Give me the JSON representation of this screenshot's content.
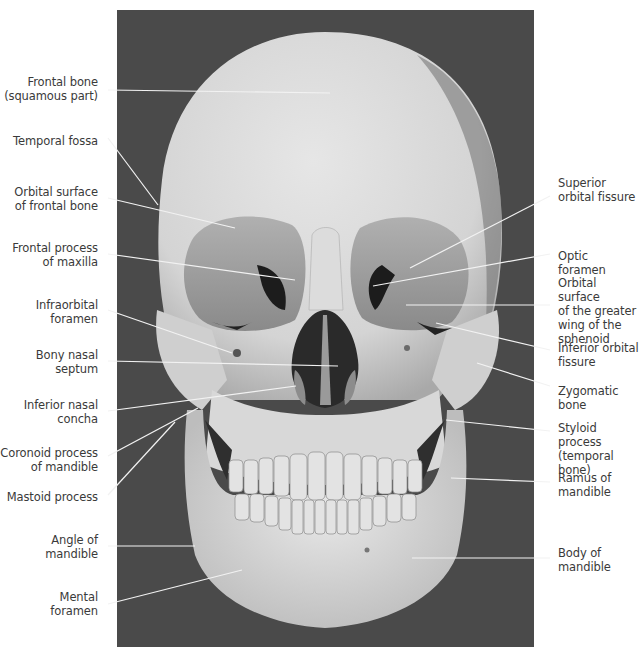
{
  "figure": {
    "background_color": "#ffffff",
    "photo_background": "#4a4a4a",
    "bone_color": "#d9d9d9",
    "label_color": "#3a3a3a",
    "leader_color": "#f2f2f2"
  },
  "labels_left": [
    {
      "id": "frontal-bone",
      "text": "Frontal bone\n(squamous part)",
      "x": 0,
      "y": 75,
      "w": 98,
      "line": [
        108,
        90,
        330,
        93
      ]
    },
    {
      "id": "temporal-fossa",
      "text": "Temporal fossa",
      "x": 0,
      "y": 134,
      "w": 98,
      "line": [
        108,
        138,
        158,
        205
      ]
    },
    {
      "id": "orbital-surface-frontal",
      "text": "Orbital surface\nof frontal bone",
      "x": 0,
      "y": 185,
      "w": 98,
      "line": [
        108,
        198,
        235,
        228
      ]
    },
    {
      "id": "frontal-process-maxilla",
      "text": "Frontal process\nof maxilla",
      "x": 0,
      "y": 241,
      "w": 98,
      "line": [
        108,
        254,
        295,
        280
      ]
    },
    {
      "id": "infraorbital-foramen",
      "text": "Infraorbital\nforamen",
      "x": 0,
      "y": 298,
      "w": 98,
      "line": [
        108,
        310,
        232,
        353
      ]
    },
    {
      "id": "bony-nasal-septum",
      "text": "Bony nasal\nseptum",
      "x": 0,
      "y": 348,
      "w": 98,
      "line": [
        108,
        361,
        338,
        366
      ]
    },
    {
      "id": "inferior-nasal-concha",
      "text": "Inferior nasal\nconcha",
      "x": 0,
      "y": 398,
      "w": 98,
      "line": [
        108,
        411,
        296,
        386
      ]
    },
    {
      "id": "coronoid-process",
      "text": "Coronoid process\nof mandible",
      "x": 0,
      "y": 446,
      "w": 98,
      "line": [
        108,
        456,
        198,
        408
      ]
    },
    {
      "id": "mastoid-process",
      "text": "Mastoid process",
      "x": 0,
      "y": 490,
      "w": 98,
      "line": [
        108,
        495,
        175,
        422
      ]
    },
    {
      "id": "angle-of-mandible",
      "text": "Angle of\nmandible",
      "x": 0,
      "y": 533,
      "w": 98,
      "line": [
        108,
        546,
        195,
        546
      ]
    },
    {
      "id": "mental-foramen",
      "text": "Mental\nforamen",
      "x": 0,
      "y": 590,
      "w": 98,
      "line": [
        108,
        604,
        242,
        570
      ]
    }
  ],
  "labels_right": [
    {
      "id": "superior-orbital-fissure",
      "text": "Superior\norbital fissure",
      "x": 558,
      "y": 176,
      "w": 81,
      "line": [
        550,
        196,
        410,
        268
      ]
    },
    {
      "id": "optic-foramen",
      "text": "Optic foramen",
      "x": 558,
      "y": 249,
      "w": 81,
      "line": [
        550,
        254,
        373,
        286
      ]
    },
    {
      "id": "orbital-surface-sphenoid",
      "text": "Orbital surface\nof the greater\nwing of the\nsphenoid",
      "x": 558,
      "y": 276,
      "w": 81,
      "line": [
        550,
        305,
        406,
        305
      ]
    },
    {
      "id": "inferior-orbital-fissure",
      "text": "Inferior orbital\nfissure",
      "x": 558,
      "y": 341,
      "w": 81,
      "line": [
        550,
        350,
        436,
        323
      ]
    },
    {
      "id": "zygomatic-bone",
      "text": "Zygomatic bone",
      "x": 558,
      "y": 384,
      "w": 81,
      "line": [
        550,
        386,
        477,
        363
      ]
    },
    {
      "id": "styloid-process",
      "text": "Styloid process\n(temporal bone)",
      "x": 558,
      "y": 421,
      "w": 81,
      "line": [
        550,
        431,
        446,
        420
      ]
    },
    {
      "id": "ramus-of-mandible",
      "text": "Ramus of\nmandible",
      "x": 558,
      "y": 471,
      "w": 81,
      "line": [
        550,
        482,
        451,
        478
      ]
    },
    {
      "id": "body-of-mandible",
      "text": "Body of\nmandible",
      "x": 558,
      "y": 546,
      "w": 81,
      "line": [
        550,
        558,
        412,
        558
      ]
    }
  ]
}
